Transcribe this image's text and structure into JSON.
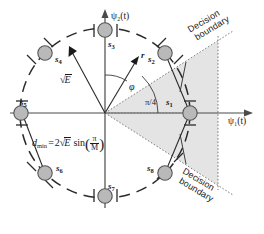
{
  "figure": {
    "type": "m-ary-psk-constellation-diagram",
    "axes": {
      "horizontal": "ψ₁(t)",
      "vertical": "ψ₂(t)",
      "origin": [
        105,
        113
      ]
    },
    "circle": {
      "radius_px": 85,
      "style": "dashed",
      "meaning": "constellation circle of radius sqrt(E)"
    },
    "colors": {
      "line": "#1a1a1a",
      "point_fill": "#b3b3b3",
      "point_stroke": "#4d4d4d",
      "shade": "#e3e3e3",
      "dotted": "#6e6e6e"
    },
    "points": [
      {
        "id": "s1",
        "label": "s",
        "sub": "1",
        "angle_deg": 0,
        "lx": 166,
        "ly": 100
      },
      {
        "id": "s2",
        "label": "s",
        "sub": "2",
        "angle_deg": 45,
        "lx": 150,
        "ly": 58
      },
      {
        "id": "s3",
        "label": "s",
        "sub": "3",
        "angle_deg": 90,
        "lx": 109,
        "ly": 41
      },
      {
        "id": "s4",
        "label": "s",
        "sub": "4",
        "angle_deg": 135,
        "lx": 54,
        "ly": 58
      },
      {
        "id": "s5",
        "label": "s",
        "sub": "5",
        "angle_deg": 180,
        "lx": 21,
        "ly": 100
      },
      {
        "id": "s6",
        "label": "s",
        "sub": "6",
        "angle_deg": 225,
        "lx": 54,
        "ly": 163
      },
      {
        "id": "s7",
        "label": "s",
        "sub": "7",
        "angle_deg": 270,
        "lx": 109,
        "ly": 180
      },
      {
        "id": "s8",
        "label": "s",
        "sub": "8",
        "angle_deg": 315,
        "lx": 150,
        "ly": 163
      }
    ],
    "annotations": {
      "energy_label": "E",
      "energy_prefix": "√",
      "received_vector": "r",
      "phase_angle": "φ",
      "sector_angle": "π/4",
      "dmin_name": "d",
      "dmin_sub": "min",
      "dmin_equals": "=",
      "dmin_coeff": "2",
      "dmin_radical": "√",
      "dmin_E": "E",
      "dmin_sin": "sin",
      "dmin_frac_num": "π",
      "dmin_frac_den": "M",
      "decision_boundary_upper": "Decision\nboundary",
      "decision_boundary_lower": "Decision\nboundary",
      "decision_line_1": "Decision",
      "decision_line_2": "boundary"
    }
  }
}
